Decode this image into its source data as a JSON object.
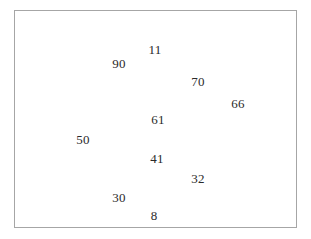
{
  "figure": {
    "background_color": "#ffffff",
    "frame_color": "#a6a6a6",
    "label_color": "#2a2a2a"
  },
  "chart_data": {
    "type": "scatter",
    "title": "",
    "subtitle": "",
    "xlabel": "",
    "ylabel": "",
    "grid": false,
    "legend": null,
    "axes_visible": false,
    "tick_labels_visible": false,
    "marker_style": "value-label-only",
    "xlim": [
      0,
      283
    ],
    "ylim": [
      0,
      218
    ],
    "note": "Each data point is drawn as its numeric value label only; no markers, axes, ticks or gridlines are shown. Coordinates are in plot-frame pixel space with origin at the frame top-left.",
    "points": [
      {
        "label": "11",
        "x": 140,
        "y": 38
      },
      {
        "label": "90",
        "x": 104,
        "y": 52
      },
      {
        "label": "70",
        "x": 183,
        "y": 70
      },
      {
        "label": "66",
        "x": 223,
        "y": 92
      },
      {
        "label": "61",
        "x": 143,
        "y": 108
      },
      {
        "label": "50",
        "x": 68,
        "y": 128
      },
      {
        "label": "41",
        "x": 142,
        "y": 147
      },
      {
        "label": "32",
        "x": 183,
        "y": 167
      },
      {
        "label": "30",
        "x": 104,
        "y": 186
      },
      {
        "label": "8",
        "x": 139,
        "y": 204
      }
    ],
    "values": [
      11,
      90,
      70,
      66,
      61,
      50,
      41,
      32,
      30,
      8
    ],
    "categories": [
      "11",
      "90",
      "70",
      "66",
      "61",
      "50",
      "41",
      "32",
      "30",
      "8"
    ]
  }
}
